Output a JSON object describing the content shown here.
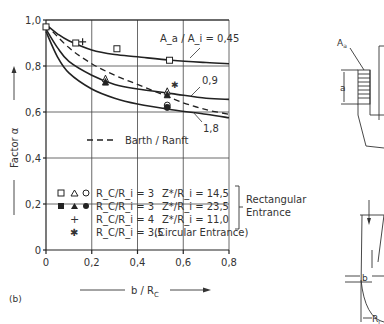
{
  "chart_data": {
    "type": "line",
    "panel_label": "(b)",
    "xlabel": "b / R_C",
    "ylabel": "Factor α",
    "xlim": [
      0,
      0.8
    ],
    "ylim": [
      0,
      1.0
    ],
    "x_ticks": [
      "0",
      "0,2",
      "0,4",
      "0,6",
      "0,8"
    ],
    "y_ticks": [
      "0",
      "0,2",
      "0,4",
      "0,6",
      "0,8",
      "1,0"
    ],
    "grid": true,
    "series": [
      {
        "name": "A_a/A_i = 0,45",
        "style": "solid",
        "x": [
          0,
          0.05,
          0.1,
          0.2,
          0.3,
          0.4,
          0.55,
          0.7,
          0.8
        ],
        "y": [
          0.98,
          0.94,
          0.91,
          0.87,
          0.85,
          0.84,
          0.825,
          0.815,
          0.81
        ]
      },
      {
        "name": "0,9",
        "style": "solid",
        "x": [
          0,
          0.05,
          0.1,
          0.2,
          0.3,
          0.4,
          0.55,
          0.7,
          0.8
        ],
        "y": [
          0.96,
          0.88,
          0.82,
          0.76,
          0.72,
          0.7,
          0.68,
          0.66,
          0.655
        ]
      },
      {
        "name": "1,8",
        "style": "solid",
        "x": [
          0,
          0.05,
          0.1,
          0.2,
          0.3,
          0.4,
          0.55,
          0.7,
          0.8
        ],
        "y": [
          0.95,
          0.84,
          0.77,
          0.7,
          0.66,
          0.635,
          0.61,
          0.59,
          0.575
        ]
      },
      {
        "name": "Barth / Ranft",
        "style": "dashed",
        "x": [
          0,
          0.1,
          0.2,
          0.3,
          0.4,
          0.5,
          0.6,
          0.7,
          0.8
        ],
        "y": [
          0.98,
          0.88,
          0.81,
          0.76,
          0.72,
          0.68,
          0.64,
          0.61,
          0.59
        ]
      }
    ],
    "markers": [
      {
        "symbol": "open-square",
        "x": 0.13,
        "y": 0.9
      },
      {
        "symbol": "open-square",
        "x": 0.31,
        "y": 0.875
      },
      {
        "symbol": "open-square",
        "x": 0.54,
        "y": 0.825
      },
      {
        "symbol": "open-square",
        "x": 0.0,
        "y": 0.97
      },
      {
        "symbol": "plus",
        "x": 0.16,
        "y": 0.905
      },
      {
        "symbol": "open-triangle",
        "x": 0.26,
        "y": 0.745
      },
      {
        "symbol": "filled-triangle",
        "x": 0.26,
        "y": 0.73
      },
      {
        "symbol": "open-triangle",
        "x": 0.53,
        "y": 0.69
      },
      {
        "symbol": "filled-triangle",
        "x": 0.53,
        "y": 0.675
      },
      {
        "symbol": "asterisk",
        "x": 0.56,
        "y": 0.7
      },
      {
        "symbol": "open-circle",
        "x": 0.53,
        "y": 0.63
      },
      {
        "symbol": "filled-circle",
        "x": 0.53,
        "y": 0.62
      }
    ],
    "annotations": [
      "A_a / A_i = 0,45",
      "0,9",
      "1,8"
    ],
    "legend": {
      "position": "inside-lower",
      "entries": [
        {
          "symbols": "□ △ ○",
          "rc": "R_C/R_i = 3",
          "z": "Z*/R_i = 14,5"
        },
        {
          "symbols": "■ ▲ ●",
          "rc": "R_C/R_i = 3",
          "z": "Z*/R_i = 23,5"
        },
        {
          "symbols": "+",
          "rc": "R_C/R_i = 4",
          "z": "Z*/R_i = 11,0"
        },
        {
          "symbols": "✱",
          "rc": "R_C/R_i = 3,5",
          "z": "(Circular Entrance)"
        }
      ],
      "bracket_label": [
        "Rectangular",
        "Entrance"
      ],
      "dashed_label": "Barth / Ranft"
    },
    "sketch_labels": {
      "area": "A_a",
      "height": "a",
      "gap": "b",
      "radius": "R_i"
    }
  }
}
